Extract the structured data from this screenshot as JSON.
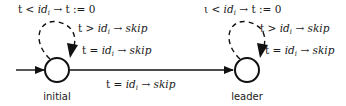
{
  "states": [
    {
      "id": "initial",
      "label": "initial",
      "initial": true
    },
    {
      "id": "leader",
      "label": "leader",
      "initial": false
    }
  ],
  "transitions": [
    {
      "from": "initial",
      "to": "initial",
      "style": "dashed",
      "guards": {
        "top": {
          "lhs": "t < ",
          "var": "id",
          "sub": "i",
          "rhs": " → t := 0"
        },
        "mid": {
          "lhs": "t > ",
          "var": "id",
          "sub": "i",
          "arrow": " → ",
          "action": "skip"
        },
        "bot": {
          "lhs": "t = ",
          "var": "id",
          "sub": "i",
          "arrow": " → ",
          "action": "skip"
        }
      }
    },
    {
      "from": "initial",
      "to": "leader",
      "style": "solid",
      "guard": {
        "lhs": "t = ",
        "var": "id",
        "sub": "i",
        "arrow": " → ",
        "action": "skip"
      }
    },
    {
      "from": "leader",
      "to": "leader",
      "style": "dashed",
      "guards": {
        "top": {
          "lhs": "ι < ",
          "var": "id",
          "sub": "i",
          "rhs": " → t := 0"
        },
        "mid": {
          "lhs": "t > ",
          "var": "id",
          "sub": "i",
          "arrow": " → ",
          "action": "skip"
        },
        "bot": {
          "lhs": "t = ",
          "var": "id",
          "sub": "i",
          "arrow": " → ",
          "action": "skip"
        }
      }
    }
  ]
}
